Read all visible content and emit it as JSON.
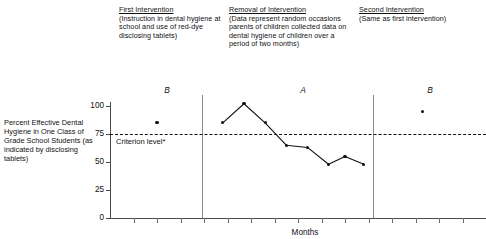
{
  "figure": {
    "phase_notes": [
      {
        "heading": "First Intervention",
        "body": "(Instruction in dental hygiene at school and use of red-dye disclosing tablets)"
      },
      {
        "heading": "Removal of Intervention",
        "body": "(Data represent random occasions parents of children collected data on dental hygiene of children over a period of two months)"
      },
      {
        "heading": "Second Intervention",
        "body": "(Same as first intervention)"
      }
    ],
    "criterion_label": "Criterion level*",
    "phase_letters": [
      "B",
      "A",
      "B"
    ]
  },
  "chart_data": {
    "type": "line",
    "title": "",
    "xlabel": "Months",
    "ylabel": "Percent Effective Dental Hygiene in One Class of Grade School Students (as indicated by disclosing tablets)",
    "ylim": [
      0,
      110
    ],
    "yticks": [
      0,
      25,
      50,
      75,
      100
    ],
    "ytick_labels": [
      "0",
      "25",
      "50",
      "75",
      "100"
    ],
    "xlim": [
      0,
      16
    ],
    "grid": false,
    "legend": "none",
    "annotations": [
      {
        "text": "Criterion level*",
        "y": 75
      }
    ],
    "reference_lines": [
      {
        "label": "Criterion level*",
        "y": 75,
        "style": "dashed",
        "color": "#111111"
      }
    ],
    "phase_dividers_x": [
      3.9,
      11.2
    ],
    "series": [
      {
        "name": "B — First Intervention",
        "connected": false,
        "x": [
          2.0
        ],
        "values": [
          85
        ]
      },
      {
        "name": "A — Removal of Intervention",
        "connected": true,
        "x": [
          4.8,
          5.7,
          6.6,
          7.5,
          8.4,
          9.3,
          10.0,
          10.8
        ],
        "values": [
          85,
          102,
          85,
          65,
          63,
          48,
          55,
          48
        ]
      },
      {
        "name": "B — Second Intervention",
        "connected": false,
        "x": [
          13.3
        ],
        "values": [
          95
        ]
      }
    ]
  }
}
